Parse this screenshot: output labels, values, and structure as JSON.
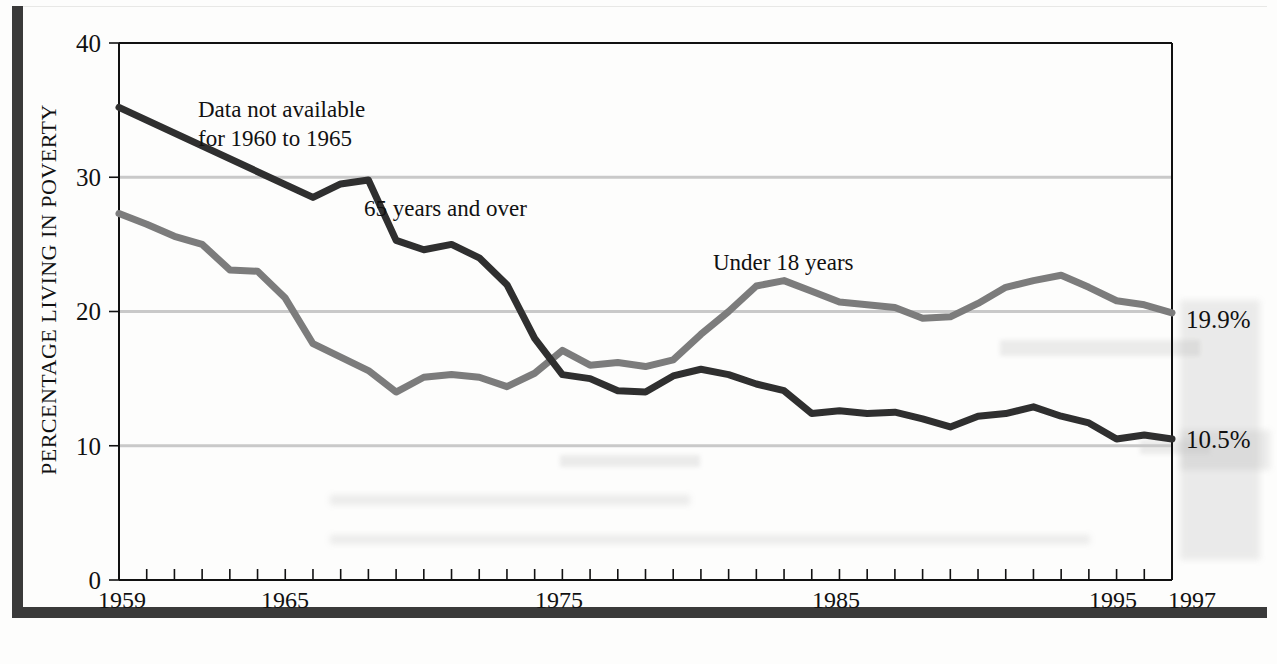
{
  "chart_data": {
    "type": "line",
    "title": "",
    "xlabel": "",
    "ylabel": "PERCENTAGE LIVING IN POVERTY",
    "xlim": [
      1959,
      1997
    ],
    "ylim": [
      0,
      40
    ],
    "grid": "horizontal gridlines at 10, 20, 30",
    "legend_position": "inline labels on plot",
    "y_ticks": [
      "0",
      "10",
      "20",
      "30",
      "40"
    ],
    "y_tick_values": [
      0,
      10,
      20,
      30,
      40
    ],
    "x_ticks": [
      "1959",
      "1965",
      "1975",
      "1985",
      "1995",
      "1997"
    ],
    "x_tick_values": [
      1959,
      1965,
      1975,
      1985,
      1995,
      1997
    ],
    "x_minor_tick_step": 1,
    "annotations": [
      {
        "id": "no-data",
        "text": "Data not available\nfor 1960 to 1965",
        "line1": "Data not available",
        "line2": "for 1960 to 1965",
        "x": 1962.0,
        "y": 36.0
      },
      {
        "id": "elderly-label",
        "text": "65 years and over",
        "x": 1968.2,
        "y": 27.2
      },
      {
        "id": "children-label",
        "text": "Under 18 years",
        "x": 1982.0,
        "y": 24.6
      }
    ],
    "end_labels": [
      {
        "series": "Under 18 years",
        "text": "19.9%",
        "value": 19.9,
        "year": 1997
      },
      {
        "series": "65 years and over",
        "text": "10.5%",
        "value": 10.5,
        "year": 1997
      }
    ],
    "series": [
      {
        "name": "65 years and over",
        "color": "#2f2f2f",
        "x": [
          1959,
          1966,
          1967,
          1968,
          1969,
          1970,
          1971,
          1972,
          1973,
          1974,
          1975,
          1976,
          1977,
          1978,
          1979,
          1980,
          1981,
          1982,
          1983,
          1984,
          1985,
          1986,
          1987,
          1988,
          1989,
          1990,
          1991,
          1992,
          1993,
          1994,
          1995,
          1996,
          1997
        ],
        "values": [
          35.2,
          28.5,
          29.5,
          29.8,
          25.3,
          24.6,
          25.0,
          24.0,
          22.0,
          18.0,
          15.3,
          15.0,
          14.1,
          14.0,
          15.2,
          15.7,
          15.3,
          14.6,
          14.1,
          12.4,
          12.6,
          12.4,
          12.5,
          12.0,
          11.4,
          12.2,
          12.4,
          12.9,
          12.2,
          11.7,
          10.5,
          10.8,
          10.5
        ],
        "style": "solid",
        "linewidth_px": 7
      },
      {
        "name": "Under 18 years",
        "color": "#7c7c7c",
        "x": [
          1959,
          1960,
          1961,
          1962,
          1963,
          1964,
          1965,
          1966,
          1967,
          1968,
          1969,
          1970,
          1971,
          1972,
          1973,
          1974,
          1975,
          1976,
          1977,
          1978,
          1979,
          1980,
          1981,
          1982,
          1983,
          1984,
          1985,
          1986,
          1987,
          1988,
          1989,
          1990,
          1991,
          1992,
          1993,
          1994,
          1995,
          1996,
          1997
        ],
        "values": [
          27.3,
          26.5,
          25.6,
          25.0,
          23.1,
          23.0,
          21.0,
          17.6,
          16.6,
          15.6,
          14.0,
          15.1,
          15.3,
          15.1,
          14.4,
          15.4,
          17.1,
          16.0,
          16.2,
          15.9,
          16.4,
          18.3,
          20.0,
          21.9,
          22.3,
          21.5,
          20.7,
          20.5,
          20.3,
          19.5,
          19.6,
          20.6,
          21.8,
          22.3,
          22.7,
          21.8,
          20.8,
          20.5,
          19.9
        ],
        "style": "solid",
        "linewidth_px": 7
      }
    ]
  },
  "colors": {
    "elderly_series": "#2f2f2f",
    "children_series": "#7c7c7c",
    "gridline": "#c9c9c9",
    "axis": "#111111",
    "frame": "#3a3a3a",
    "background": "#fdfdfc"
  }
}
